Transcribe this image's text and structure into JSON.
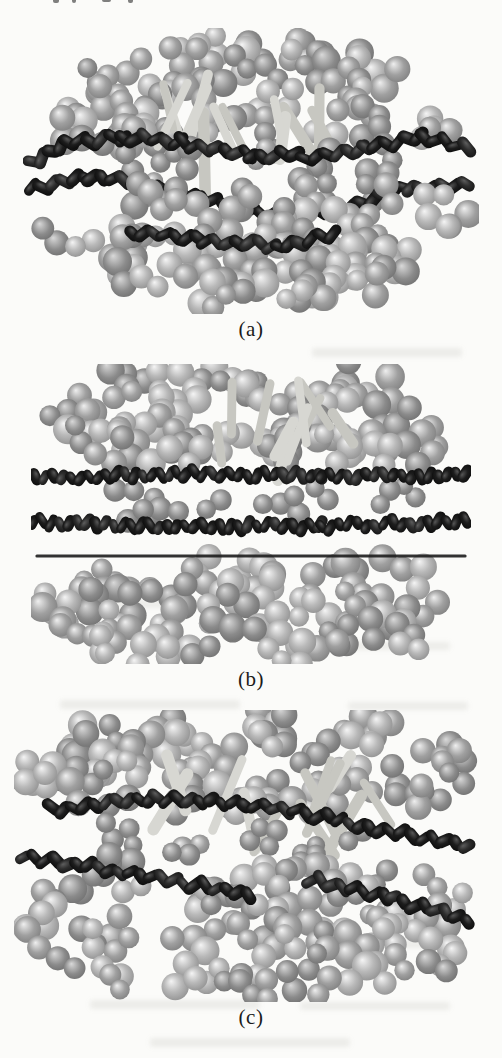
{
  "page": {
    "background": "#fbfbf9",
    "kind": "scanned-journal-figure"
  },
  "figure": {
    "caption_color": "#1b1b1b",
    "colors": {
      "light_sphere_base": "#a0a0a0",
      "light_sphere_bright": "#b9b9b9",
      "light_sphere_dim": "#8b8b8b",
      "light_highlight": "#efefef",
      "dark_sphere_base": "#1d1d1d",
      "dark_sphere_sheen": "#575757",
      "dark_sphere_alt": "#2e2e2e",
      "rod": "#d7d7d2",
      "rod_dim": "#c7c7c1",
      "band_line": "#1c1c1c"
    },
    "panels": [
      {
        "caption": "(a)",
        "alt": "Oblate sphere-dimer aggregate viewed obliquely, wrapped by wavy dark bead chains around its equator with light rods in the core",
        "render": {
          "seed": 101,
          "width": 456,
          "height": 286,
          "upper": {
            "cx": 0.5,
            "cy": 0.4,
            "rx": 0.46,
            "ry": 0.36,
            "ymin": 0.04,
            "ymax": 0.4,
            "count": 60,
            "rmin": 11,
            "rmax": 15
          },
          "mid": {
            "cx": 0.5,
            "cy": 0.5,
            "rx": 0.42,
            "ry": 0.12,
            "ymin": 0.42,
            "ymax": 0.58,
            "count": 12,
            "rmin": 10,
            "rmax": 13,
            "shade": "dim"
          },
          "lower": {
            "cx": 0.5,
            "cy": 0.62,
            "rx": 0.47,
            "ry": 0.34,
            "ymin": 0.58,
            "ymax": 0.96,
            "count": 64,
            "rmin": 11,
            "rmax": 15
          },
          "rods": {
            "count": 13,
            "x": [
              0.28,
              0.72
            ],
            "y": [
              0.16,
              0.34
            ],
            "len": [
              0.14,
              0.3
            ]
          },
          "bands": [
            {
              "points": [
                [
                  0.02,
                  0.47
                ],
                [
                  0.1,
                  0.4
                ],
                [
                  0.22,
                  0.38
                ],
                [
                  0.35,
                  0.4
                ],
                [
                  0.5,
                  0.44
                ],
                [
                  0.62,
                  0.45
                ],
                [
                  0.75,
                  0.42
                ],
                [
                  0.88,
                  0.38
                ],
                [
                  0.99,
                  0.43
                ]
              ],
              "twist": 38,
              "cap": [
                21,
                11
              ],
              "step": 11,
              "front": false
            },
            {
              "points": [
                [
                  0.02,
                  0.56
                ],
                [
                  0.15,
                  0.52
                ],
                [
                  0.3,
                  0.56
                ],
                [
                  0.45,
                  0.62
                ],
                [
                  0.58,
                  0.66
                ],
                [
                  0.72,
                  0.62
                ],
                [
                  0.85,
                  0.56
                ],
                [
                  0.99,
                  0.55
                ]
              ],
              "twist": -38,
              "cap": [
                21,
                11
              ],
              "step": 11,
              "front": false
            },
            {
              "points": [
                [
                  0.24,
                  0.71
                ],
                [
                  0.4,
                  0.74
                ],
                [
                  0.56,
                  0.76
                ],
                [
                  0.7,
                  0.72
                ]
              ],
              "twist": 38,
              "cap": [
                20,
                11
              ],
              "step": 11,
              "front": true
            }
          ],
          "line": null
        }
      },
      {
        "caption": "(b)",
        "alt": "Same aggregate viewed edge-on with two straight horizontal dark bead rows and a thin dark axis line through the equator",
        "render": {
          "seed": 202,
          "width": 440,
          "height": 300,
          "upper": {
            "cx": 0.5,
            "cy": 0.2,
            "rx": 0.47,
            "ry": 0.23,
            "ymin": 0.02,
            "ymax": 0.33,
            "count": 60,
            "rmin": 11,
            "rmax": 15
          },
          "mid": {
            "cx": 0.5,
            "cy": 0.46,
            "rx": 0.4,
            "ry": 0.08,
            "ymin": 0.41,
            "ymax": 0.51,
            "count": 10,
            "rmin": 10,
            "rmax": 12,
            "shade": "dim"
          },
          "lower": {
            "cx": 0.5,
            "cy": 0.8,
            "rx": 0.46,
            "ry": 0.23,
            "ymin": 0.66,
            "ymax": 0.97,
            "count": 60,
            "rmin": 11,
            "rmax": 15
          },
          "rods": {
            "count": 10,
            "x": [
              0.25,
              0.75
            ],
            "y": [
              0.05,
              0.22
            ],
            "len": [
              0.1,
              0.22
            ]
          },
          "bands": [
            {
              "points": [
                [
                  0.01,
                  0.38
                ],
                [
                  0.33,
                  0.365
                ],
                [
                  0.66,
                  0.375
                ],
                [
                  0.99,
                  0.37
                ]
              ],
              "twist": 60,
              "cap": [
                17,
                10
              ],
              "step": 9,
              "front": false
            },
            {
              "points": [
                [
                  0.005,
                  0.525
                ],
                [
                  0.33,
                  0.545
                ],
                [
                  0.66,
                  0.54
                ],
                [
                  0.995,
                  0.525
                ]
              ],
              "twist": -60,
              "cap": [
                17,
                10
              ],
              "step": 9,
              "front": false
            }
          ],
          "line": {
            "x": [
              0.01,
              0.99
            ],
            "y": 0.635,
            "h": 3
          }
        }
      },
      {
        "caption": "(c)",
        "alt": "Same aggregate with two dark bead strands crossing the equator at a slight diagonal, lower strand broken in the middle",
        "render": {
          "seed": 303,
          "width": 474,
          "height": 292,
          "upper": {
            "cx": 0.5,
            "cy": 0.21,
            "rx": 0.47,
            "ry": 0.23,
            "ymin": 0.03,
            "ymax": 0.33,
            "count": 62,
            "rmin": 11,
            "rmax": 15
          },
          "mid": {
            "cx": 0.5,
            "cy": 0.46,
            "rx": 0.42,
            "ry": 0.1,
            "ymin": 0.4,
            "ymax": 0.54,
            "count": 10,
            "rmin": 10,
            "rmax": 12,
            "shade": "dim"
          },
          "lower": {
            "cx": 0.5,
            "cy": 0.73,
            "rx": 0.48,
            "ry": 0.27,
            "ymin": 0.52,
            "ymax": 0.97,
            "count": 68,
            "rmin": 11,
            "rmax": 15
          },
          "rods": {
            "count": 12,
            "x": [
              0.3,
              0.75
            ],
            "y": [
              0.12,
              0.35
            ],
            "len": [
              0.12,
              0.28
            ]
          },
          "bands": [
            {
              "points": [
                [
                  0.08,
                  0.34
                ],
                [
                  0.3,
                  0.3
                ],
                [
                  0.55,
                  0.33
                ],
                [
                  0.75,
                  0.4
                ],
                [
                  0.96,
                  0.47
                ]
              ],
              "twist": 40,
              "cap": [
                20,
                11
              ],
              "step": 11,
              "front": false
            },
            {
              "points": [
                [
                  0.02,
                  0.5
                ],
                [
                  0.2,
                  0.545
                ],
                [
                  0.38,
                  0.6
                ],
                [
                  0.5,
                  0.635
                ]
              ],
              "twist": -40,
              "cap": [
                20,
                11
              ],
              "step": 11,
              "front": true
            },
            {
              "points": [
                [
                  0.625,
                  0.58
                ],
                [
                  0.8,
                  0.645
                ],
                [
                  0.96,
                  0.72
                ]
              ],
              "twist": -40,
              "cap": [
                20,
                11
              ],
              "step": 11,
              "front": true
            }
          ],
          "line": null
        }
      }
    ],
    "artifacts": {
      "top_fragments": [
        [
          53,
          0,
          6,
          5
        ],
        [
          72,
          0,
          4,
          5
        ],
        [
          102,
          0,
          9,
          4
        ],
        [
          128,
          0,
          5,
          5
        ]
      ],
      "showthrough": [
        [
          312,
          348,
          150,
          9
        ],
        [
          70,
          600,
          140,
          8
        ],
        [
          330,
          642,
          120,
          8
        ],
        [
          60,
          700,
          180,
          9
        ],
        [
          348,
          702,
          120,
          8
        ],
        [
          330,
          940,
          130,
          8
        ],
        [
          90,
          1000,
          170,
          9
        ],
        [
          300,
          1002,
          150,
          8
        ],
        [
          150,
          1038,
          200,
          9
        ]
      ]
    }
  }
}
